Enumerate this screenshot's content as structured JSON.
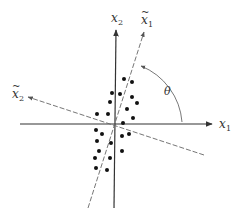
{
  "diagram": {
    "type": "coordinate-rotation",
    "colors": {
      "axis": "#333333",
      "dashed_axis": "#666666",
      "dots": "#111111",
      "background": "#ffffff"
    },
    "labels": {
      "x1": {
        "base": "x",
        "sub": "1",
        "tilde": false
      },
      "x2": {
        "base": "x",
        "sub": "2",
        "tilde": false
      },
      "x1_tilde": {
        "base": "x",
        "sub": "1",
        "tilde": true
      },
      "x2_tilde": {
        "base": "x",
        "sub": "2",
        "tilde": true
      },
      "angle": "θ"
    },
    "tilde_glyph": "~",
    "origin": [
      115,
      124
    ],
    "dots": [
      [
        124,
        79
      ],
      [
        132,
        82
      ],
      [
        112,
        93
      ],
      [
        120,
        94
      ],
      [
        110,
        102
      ],
      [
        132,
        97
      ],
      [
        137,
        103
      ],
      [
        97,
        114
      ],
      [
        108,
        114
      ],
      [
        127,
        109
      ],
      [
        133,
        118
      ],
      [
        123,
        123
      ],
      [
        96,
        130
      ],
      [
        102,
        134
      ],
      [
        97,
        141
      ],
      [
        111,
        143
      ],
      [
        99,
        151
      ],
      [
        95,
        158
      ],
      [
        110,
        158
      ],
      [
        122,
        136
      ],
      [
        129,
        134
      ],
      [
        122,
        151
      ],
      [
        96,
        168
      ],
      [
        107,
        170
      ]
    ]
  }
}
